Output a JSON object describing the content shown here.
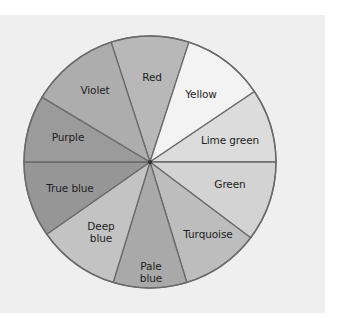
{
  "diagram": {
    "center": [
      150,
      162
    ],
    "radius": 126,
    "outline_color": "#6a6a6a",
    "background": "#efefef",
    "segments": [
      {
        "label": "Red",
        "start": -18,
        "end": 18,
        "fill": "#b8b8b8",
        "label_pos": [
          152,
          77
        ]
      },
      {
        "label": "Yellow",
        "start": 18,
        "end": 56,
        "fill": "#f3f3f3",
        "label_pos": [
          201,
          94
        ]
      },
      {
        "label": "Lime green",
        "start": 56,
        "end": 90,
        "fill": "#dcdcdc",
        "label_pos": [
          230,
          140
        ]
      },
      {
        "label": "Green",
        "start": 90,
        "end": 127,
        "fill": "#d3d3d3",
        "label_pos": [
          230,
          184
        ]
      },
      {
        "label": "Turquoise",
        "start": 127,
        "end": 163,
        "fill": "#bdbdbd",
        "label_pos": [
          208,
          234
        ]
      },
      {
        "label": "Pale\nblue",
        "start": 163,
        "end": 197,
        "fill": "#a9a9a9",
        "label_pos": [
          151,
          272
        ]
      },
      {
        "label": "Deep\nblue",
        "start": 197,
        "end": 235,
        "fill": "#c3c3c3",
        "label_pos": [
          101,
          232
        ]
      },
      {
        "label": "True blue",
        "start": 235,
        "end": 270,
        "fill": "#969696",
        "label_pos": [
          70,
          188
        ]
      },
      {
        "label": "Purple",
        "start": 270,
        "end": 301,
        "fill": "#9b9b9b",
        "label_pos": [
          68,
          137
        ]
      },
      {
        "label": "Violet",
        "start": 301,
        "end": 342,
        "fill": "#adadad",
        "label_pos": [
          95,
          90
        ]
      }
    ]
  }
}
